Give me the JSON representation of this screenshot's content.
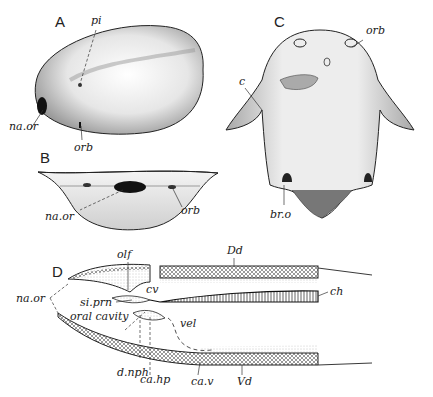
{
  "figure": {
    "panels": [
      {
        "id": "A",
        "labels": [
          "pi",
          "na.or",
          "orb"
        ]
      },
      {
        "id": "B",
        "labels": [
          "na.or",
          "orb"
        ]
      },
      {
        "id": "C",
        "labels": [
          "orb",
          "c",
          "br.o"
        ]
      },
      {
        "id": "D",
        "labels": [
          "olf",
          "Dd",
          "na.or",
          "cv",
          "ch",
          "si.prn",
          "oral cavity",
          "vel",
          "d.nph",
          "ca.hp",
          "ca.v",
          "Vd"
        ]
      }
    ]
  },
  "panelA": {
    "letter": "A",
    "pi": "pi",
    "naor": "na.or",
    "orb": "orb"
  },
  "panelB": {
    "letter": "B",
    "naor": "na.or",
    "orb": "orb"
  },
  "panelC": {
    "letter": "C",
    "orb": "orb",
    "c": "c",
    "bro": "br.o"
  },
  "panelD": {
    "letter": "D",
    "olf": "olf",
    "Dd": "Dd",
    "naor": "na.or",
    "cv": "cv",
    "ch": "ch",
    "siprn": "si.prn",
    "oral": "oral cavity",
    "vel": "vel",
    "dnph": "d.nph",
    "cahp": "ca.hp",
    "cav": "ca.v",
    "Vd": "Vd"
  }
}
